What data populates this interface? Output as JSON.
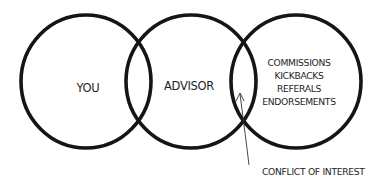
{
  "diagram": {
    "type": "venn",
    "circles": [
      {
        "id": "you",
        "label": "YOU"
      },
      {
        "id": "advisor",
        "label": "ADVISOR"
      },
      {
        "id": "incentives",
        "items": [
          "COMMISSIONS",
          "KICKBACKS",
          "REFERALS",
          "ENDORSEMENTS"
        ]
      }
    ],
    "callout": {
      "label": "CONFLICT OF INTEREST",
      "points_to": "overlap of advisor and incentives"
    },
    "colors": {
      "stroke": "#151515",
      "text": "#1e1e1e",
      "background": "#ffffff"
    }
  }
}
